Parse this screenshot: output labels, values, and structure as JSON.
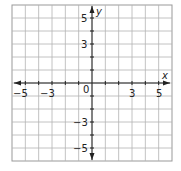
{
  "chart_data": {
    "type": "coordinate-grid",
    "title": "",
    "xlabel": "x",
    "ylabel": "y",
    "xlim": [
      -6,
      6
    ],
    "ylim": [
      -6,
      6
    ],
    "grid": true,
    "x_tick_labels": [
      "-5",
      "-3",
      "0",
      "3",
      "5"
    ],
    "y_tick_labels": [
      "5",
      "3",
      "-3",
      "-5"
    ],
    "origin_label": "0",
    "points": []
  },
  "labels": {
    "x_axis": "x",
    "y_axis": "y",
    "origin": "0",
    "xt": [
      "−5",
      "−3",
      "3",
      "5"
    ],
    "yt": [
      "5",
      "3",
      "−3",
      "−5"
    ]
  }
}
